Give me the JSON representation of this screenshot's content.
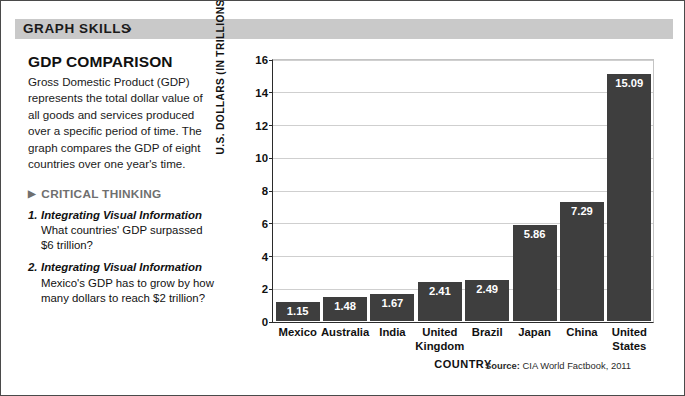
{
  "banner": {
    "label": "GRAPH SKILLS",
    "chevron": "›",
    "background": "#c9c9c9"
  },
  "left_panel": {
    "title": "GDP COMPARISON",
    "body": "Gross Domestic Product (GDP) represents the total dollar value of all goods and services produced over a specific period of time. The graph compares the GDP of eight countries over one year's time.",
    "critical_thinking": {
      "triangle": "▶",
      "heading": "CRITICAL THINKING",
      "questions": [
        {
          "number": "1.",
          "lead": "Integrating Visual Information",
          "text": " What countries' GDP surpassed $6 trillion?"
        },
        {
          "number": "2.",
          "lead": "Integrating Visual Information",
          "text": " Mexico's GDP has to grow by how many dollars to reach $2 trillion?"
        }
      ]
    }
  },
  "chart_data": {
    "type": "bar",
    "title": "GDP COMPARISON",
    "categories": [
      "Mexico",
      "Australia",
      "India",
      "United Kingdom",
      "Brazil",
      "Japan",
      "China",
      "United States"
    ],
    "values": [
      1.15,
      1.48,
      1.67,
      2.41,
      2.49,
      5.86,
      7.29,
      15.09
    ],
    "value_labels": [
      "1.15",
      "1.48",
      "1.67",
      "2.41",
      "2.49",
      "5.86",
      "7.29",
      "15.09"
    ],
    "xlabel": "COUNTRY",
    "ylabel": "U.S. DOLLARS (IN TRILLIONS)",
    "ylim": [
      0,
      16
    ],
    "yticks": [
      0,
      2,
      4,
      6,
      8,
      10,
      12,
      14,
      16
    ],
    "ytick_labels": [
      "0",
      "2",
      "4",
      "6",
      "8",
      "10",
      "12",
      "14",
      "16"
    ],
    "grid": true,
    "legend": false,
    "bar_color": "#3e3e3e",
    "value_label_color": "#ffffff",
    "gridline_color": "#cfcfcf"
  },
  "source": {
    "prefix": "Source:",
    "text": " CIA World Factbook, 2011"
  }
}
